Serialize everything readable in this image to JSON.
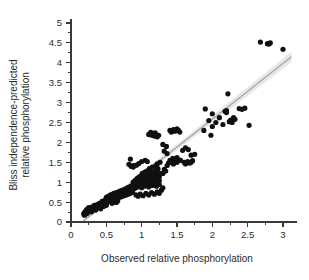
{
  "chart_data": {
    "type": "scatter",
    "title": "",
    "subtitle": "",
    "xlabel": "Observed relative phosphorylation",
    "ylabel_line1": "Bliss independence-predicted",
    "ylabel_line2": "relative phosphorylation",
    "ylabel": "Bliss independence-predicted relative phosphorylation",
    "xlim": [
      0,
      3.2
    ],
    "ylim": [
      0,
      5.1
    ],
    "xticks": [
      0,
      0.5,
      1,
      1.5,
      2,
      2.5,
      3
    ],
    "xtick_labels": [
      "0",
      "0.5",
      "1",
      "1.5",
      "2",
      "2.5",
      "3"
    ],
    "yticks": [
      0,
      0.5,
      1,
      1.5,
      2,
      2.5,
      3,
      3.5,
      4,
      4.5,
      5
    ],
    "ytick_labels": [
      "0",
      "0.5",
      "1",
      "1.5",
      "2",
      "2.5",
      "3",
      "3.5",
      "4",
      "4.5",
      "5"
    ],
    "x_minor_tick_step": 0.25,
    "y_minor_tick_step": 0.25,
    "grid": false,
    "legend": "none",
    "point_color": "#101010",
    "point_radius": 2.6,
    "fit_line": {
      "type": "linear",
      "color": "#a6a6a6",
      "band_color": "#d9d9d9",
      "x_start": 0.17,
      "x_end": 3.12,
      "y_start": 0.02,
      "y_end": 4.15,
      "band_half_width_start": 0.035,
      "band_half_width_end": 0.13
    },
    "points": [
      [
        0.18,
        0.21
      ],
      [
        0.19,
        0.17
      ],
      [
        0.2,
        0.26
      ],
      [
        0.21,
        0.2
      ],
      [
        0.22,
        0.31
      ],
      [
        0.23,
        0.22
      ],
      [
        0.25,
        0.36
      ],
      [
        0.26,
        0.29
      ],
      [
        0.28,
        0.33
      ],
      [
        0.29,
        0.26
      ],
      [
        0.3,
        0.38
      ],
      [
        0.31,
        0.31
      ],
      [
        0.33,
        0.42
      ],
      [
        0.34,
        0.35
      ],
      [
        0.35,
        0.3
      ],
      [
        0.37,
        0.44
      ],
      [
        0.38,
        0.36
      ],
      [
        0.4,
        0.47
      ],
      [
        0.41,
        0.4
      ],
      [
        0.42,
        0.33
      ],
      [
        0.44,
        0.52
      ],
      [
        0.45,
        0.45
      ],
      [
        0.46,
        0.39
      ],
      [
        0.48,
        0.55
      ],
      [
        0.49,
        0.48
      ],
      [
        0.5,
        0.42
      ],
      [
        0.5,
        0.62
      ],
      [
        0.51,
        0.57
      ],
      [
        0.52,
        0.5
      ],
      [
        0.53,
        0.65
      ],
      [
        0.54,
        0.58
      ],
      [
        0.55,
        0.52
      ],
      [
        0.56,
        0.68
      ],
      [
        0.57,
        0.61
      ],
      [
        0.58,
        0.55
      ],
      [
        0.59,
        0.7
      ],
      [
        0.6,
        0.63
      ],
      [
        0.6,
        0.57
      ],
      [
        0.61,
        0.72
      ],
      [
        0.62,
        0.66
      ],
      [
        0.63,
        0.59
      ],
      [
        0.64,
        0.74
      ],
      [
        0.65,
        0.67
      ],
      [
        0.66,
        0.61
      ],
      [
        0.67,
        0.76
      ],
      [
        0.68,
        0.69
      ],
      [
        0.69,
        0.62
      ],
      [
        0.7,
        0.78
      ],
      [
        0.71,
        0.7
      ],
      [
        0.72,
        0.64
      ],
      [
        0.73,
        0.8
      ],
      [
        0.74,
        0.72
      ],
      [
        0.75,
        0.66
      ],
      [
        0.76,
        0.82
      ],
      [
        0.77,
        0.74
      ],
      [
        0.78,
        0.68
      ],
      [
        0.79,
        0.85
      ],
      [
        0.8,
        0.76
      ],
      [
        0.81,
        0.7
      ],
      [
        0.82,
        0.88
      ],
      [
        0.83,
        0.79
      ],
      [
        0.84,
        0.72
      ],
      [
        0.85,
        1.4
      ],
      [
        0.87,
        1.41
      ],
      [
        0.88,
        1.38
      ],
      [
        0.85,
        0.9
      ],
      [
        0.86,
        0.82
      ],
      [
        0.87,
        0.75
      ],
      [
        0.88,
        1.0
      ],
      [
        0.89,
        0.92
      ],
      [
        0.9,
        0.84
      ],
      [
        0.91,
        1.05
      ],
      [
        0.92,
        0.95
      ],
      [
        0.93,
        0.87
      ],
      [
        0.94,
        1.1
      ],
      [
        0.95,
        0.98
      ],
      [
        0.96,
        0.9
      ],
      [
        0.97,
        1.14
      ],
      [
        0.98,
        1.02
      ],
      [
        0.99,
        0.93
      ],
      [
        1.0,
        1.18
      ],
      [
        1.0,
        1.06
      ],
      [
        1.0,
        0.96
      ],
      [
        1.0,
        0.86
      ],
      [
        1.01,
        1.22
      ],
      [
        1.02,
        1.1
      ],
      [
        1.03,
        1.0
      ],
      [
        1.04,
        0.9
      ],
      [
        1.05,
        1.26
      ],
      [
        1.06,
        1.14
      ],
      [
        1.07,
        1.04
      ],
      [
        1.08,
        0.94
      ],
      [
        1.09,
        1.3
      ],
      [
        1.1,
        1.18
      ],
      [
        1.1,
        1.08
      ],
      [
        1.1,
        0.98
      ],
      [
        1.1,
        0.88
      ],
      [
        1.11,
        1.34
      ],
      [
        1.12,
        1.22
      ],
      [
        1.13,
        1.12
      ],
      [
        1.14,
        1.02
      ],
      [
        1.15,
        0.92
      ],
      [
        1.15,
        1.38
      ],
      [
        1.16,
        1.26
      ],
      [
        1.17,
        1.16
      ],
      [
        1.18,
        1.06
      ],
      [
        1.19,
        0.96
      ],
      [
        1.2,
        1.42
      ],
      [
        1.2,
        1.3
      ],
      [
        1.2,
        1.2
      ],
      [
        1.2,
        1.1
      ],
      [
        1.2,
        1.0
      ],
      [
        1.21,
        0.9
      ],
      [
        1.22,
        1.46
      ],
      [
        1.23,
        1.34
      ],
      [
        1.24,
        1.24
      ],
      [
        1.25,
        1.14
      ],
      [
        1.25,
        1.04
      ],
      [
        1.25,
        0.94
      ],
      [
        1.26,
        1.5
      ],
      [
        1.05,
        1.55
      ],
      [
        1.08,
        1.52
      ],
      [
        0.84,
        1.58
      ],
      [
        0.96,
        1.47
      ],
      [
        1.0,
        1.52
      ],
      [
        1.1,
        2.2
      ],
      [
        1.12,
        2.22
      ],
      [
        1.14,
        2.18
      ],
      [
        1.16,
        2.21
      ],
      [
        1.18,
        2.16
      ],
      [
        1.2,
        2.2
      ],
      [
        1.22,
        2.14
      ],
      [
        1.24,
        2.18
      ],
      [
        1.13,
        2.25
      ],
      [
        1.19,
        2.24
      ],
      [
        0.82,
        1.45
      ],
      [
        0.9,
        1.42
      ],
      [
        0.93,
        1.43
      ],
      [
        0.6,
        0.5
      ],
      [
        0.62,
        0.52
      ],
      [
        0.64,
        0.49
      ],
      [
        0.58,
        0.47
      ],
      [
        0.66,
        0.53
      ],
      [
        0.92,
        0.68
      ],
      [
        0.95,
        0.65
      ],
      [
        0.98,
        0.7
      ],
      [
        1.02,
        0.66
      ],
      [
        1.06,
        0.72
      ],
      [
        1.1,
        0.68
      ],
      [
        1.14,
        0.74
      ],
      [
        1.18,
        0.7
      ],
      [
        1.22,
        0.76
      ],
      [
        1.25,
        0.72
      ],
      [
        1.28,
        0.8
      ],
      [
        1.3,
        0.86
      ],
      [
        1.3,
        1.22
      ],
      [
        1.32,
        1.32
      ],
      [
        1.34,
        1.28
      ],
      [
        1.36,
        1.42
      ],
      [
        1.38,
        1.48
      ],
      [
        1.4,
        1.55
      ],
      [
        1.42,
        1.5
      ],
      [
        1.44,
        1.6
      ],
      [
        1.45,
        1.46
      ],
      [
        1.46,
        1.52
      ],
      [
        1.48,
        1.58
      ],
      [
        1.5,
        1.62
      ],
      [
        1.5,
        1.5
      ],
      [
        1.52,
        1.56
      ],
      [
        1.32,
        1.78
      ],
      [
        1.36,
        1.72
      ],
      [
        1.4,
        2.3
      ],
      [
        1.42,
        2.26
      ],
      [
        1.45,
        2.32
      ],
      [
        1.47,
        2.28
      ],
      [
        1.5,
        2.34
      ],
      [
        1.52,
        2.3
      ],
      [
        1.54,
        2.26
      ],
      [
        1.3,
        1.95
      ],
      [
        1.35,
        1.9
      ],
      [
        1.55,
        1.55
      ],
      [
        1.6,
        1.5
      ],
      [
        1.62,
        1.46
      ],
      [
        1.65,
        1.52
      ],
      [
        1.68,
        1.48
      ],
      [
        1.7,
        1.5
      ],
      [
        1.72,
        1.54
      ],
      [
        1.58,
        1.8
      ],
      [
        1.62,
        1.86
      ],
      [
        1.66,
        1.82
      ],
      [
        1.7,
        1.68
      ],
      [
        1.75,
        1.7
      ],
      [
        1.88,
        2.3
      ],
      [
        1.9,
        2.84
      ],
      [
        1.95,
        2.55
      ],
      [
        1.98,
        2.18
      ],
      [
        2.0,
        2.4
      ],
      [
        2.05,
        2.5
      ],
      [
        2.1,
        2.62
      ],
      [
        2.15,
        2.45
      ],
      [
        2.18,
        2.78
      ],
      [
        2.2,
        2.8
      ],
      [
        2.2,
        2.75
      ],
      [
        2.22,
        3.22
      ],
      [
        2.24,
        2.52
      ],
      [
        2.26,
        2.56
      ],
      [
        2.28,
        2.5
      ],
      [
        2.3,
        2.62
      ],
      [
        2.32,
        2.58
      ],
      [
        2.38,
        2.85
      ],
      [
        2.42,
        2.83
      ],
      [
        2.46,
        2.86
      ],
      [
        2.52,
        2.43
      ],
      [
        2.0,
        2.72
      ],
      [
        2.68,
        4.52
      ],
      [
        2.78,
        4.48
      ],
      [
        2.8,
        4.47
      ],
      [
        2.82,
        4.5
      ],
      [
        3.0,
        4.34
      ]
    ]
  }
}
